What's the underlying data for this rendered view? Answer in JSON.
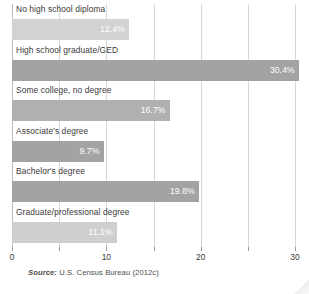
{
  "chart_data": {
    "type": "bar",
    "orientation": "horizontal",
    "title": "",
    "xlabel": "",
    "ylabel": "",
    "xlim": [
      0,
      30
    ],
    "grid": true,
    "legend": null,
    "categories": [
      "No high school diploma",
      "High school graduate/GED",
      "Some college, no degree",
      "Associate's degree",
      "Bachelor's degree",
      "Graduate/professional degree"
    ],
    "values": [
      12.4,
      30.4,
      16.7,
      9.7,
      19.8,
      11.1
    ],
    "value_labels": [
      "12.4%",
      "30.4%",
      "16.7%",
      "9.7%",
      "19.8%",
      "11.1%"
    ],
    "bar_colors": [
      "#d2d2d2",
      "#a3a3a3",
      "#b0b0b0",
      "#a3a3a3",
      "#a3a3a3",
      "#cfcfcf"
    ],
    "xticks": [
      0,
      5,
      10,
      15,
      20,
      25,
      30
    ],
    "xtick_labels": [
      "0",
      "",
      "10",
      "",
      "20",
      "",
      "30"
    ]
  },
  "source": {
    "label": "Source:",
    "text": " U.S. Census Bureau (2012c)"
  },
  "colors": {
    "gridline": "#d8d8d8",
    "axis": "#bdbdbd",
    "text": "#3a3a3a",
    "value_text": "#ffffff",
    "background": "#ffffff"
  }
}
